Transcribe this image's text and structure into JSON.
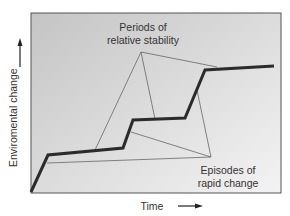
{
  "diagram": {
    "y_axis_label": "Enviromental change",
    "x_axis_label": "Time",
    "annotation_stability": {
      "line1": "Periods of",
      "line2": "relative stability"
    },
    "annotation_episodes": {
      "line1": "Episodes of",
      "line2": "rapid change"
    },
    "colors": {
      "frame": "#555555",
      "background_top": "#c6c6c6",
      "background_bottom": "#f2f2f2",
      "main_line": "#2b2b2b",
      "pointer_lines": "#666666",
      "text": "#333333"
    },
    "main_line_points": [
      [
        31,
        192
      ],
      [
        48,
        155
      ],
      [
        123,
        148
      ],
      [
        133,
        120
      ],
      [
        185,
        118
      ],
      [
        205,
        70
      ],
      [
        274,
        66
      ]
    ],
    "stability_pointer": {
      "origin": [
        141,
        52
      ],
      "targets": [
        [
          95,
          150
        ],
        [
          155,
          119
        ],
        [
          217,
          67
        ]
      ]
    },
    "episodes_pointer": {
      "origin": [
        211,
        157
      ],
      "targets": [
        [
          47,
          163
        ],
        [
          131,
          132
        ],
        [
          197,
          90
        ]
      ]
    }
  }
}
